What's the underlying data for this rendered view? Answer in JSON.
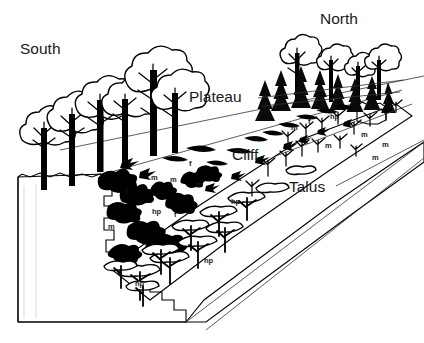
{
  "figure": {
    "type": "block-diagram",
    "orientation_labels": [
      {
        "id": "south",
        "text": "South",
        "x": 20,
        "y": 54
      },
      {
        "id": "north",
        "text": "North",
        "x": 320,
        "y": 24
      }
    ],
    "zone_labels": [
      {
        "id": "plateau",
        "text": "Plateau",
        "x": 189,
        "y": 102
      },
      {
        "id": "cliff",
        "text": "Cliff",
        "x": 232,
        "y": 160
      },
      {
        "id": "talus",
        "text": "Talus",
        "x": 289,
        "y": 192
      }
    ],
    "species_codes": [
      {
        "code": "m",
        "x": 108,
        "y": 229
      },
      {
        "code": "f",
        "x": 125,
        "y": 194
      },
      {
        "code": "m",
        "x": 151,
        "y": 180
      },
      {
        "code": "m",
        "x": 170,
        "y": 182
      },
      {
        "code": "hp",
        "x": 152,
        "y": 214
      },
      {
        "code": "f",
        "x": 174,
        "y": 217
      },
      {
        "code": "f",
        "x": 189,
        "y": 166
      },
      {
        "code": "m",
        "x": 196,
        "y": 187
      },
      {
        "code": "hp",
        "x": 231,
        "y": 204
      },
      {
        "code": "hp",
        "x": 135,
        "y": 286
      },
      {
        "code": "hp",
        "x": 204,
        "y": 263
      },
      {
        "code": "m",
        "x": 291,
        "y": 130
      },
      {
        "code": "f",
        "x": 308,
        "y": 124
      },
      {
        "code": "hp",
        "x": 330,
        "y": 119
      },
      {
        "code": "m",
        "x": 325,
        "y": 148
      },
      {
        "code": "m",
        "x": 361,
        "y": 137
      },
      {
        "code": "m",
        "x": 382,
        "y": 147
      },
      {
        "code": "m",
        "x": 372,
        "y": 160
      }
    ],
    "legend_note": "m, f and hp denote vegetation/microhabitat categories annotated on the cliff face and talus slope",
    "colors": {
      "ink": "#000000",
      "rock_fill": "#d9d9d9",
      "background": "#ffffff",
      "leader_line": "#333333"
    }
  }
}
